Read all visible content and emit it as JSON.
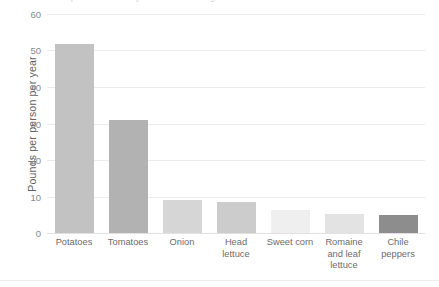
{
  "title_sliver": "Per capita availability of selected vegetables",
  "footer_rule": true,
  "axis": {
    "y_title": "Pounds per person per year",
    "y_ticks": [
      "60",
      "50",
      "40",
      "30",
      "20",
      "10",
      "0"
    ]
  },
  "chart_data": {
    "type": "bar",
    "title": "",
    "xlabel": "",
    "ylabel": "Pounds per person per year",
    "ylim": [
      0,
      60
    ],
    "yticks": [
      0,
      10,
      20,
      30,
      40,
      50,
      60
    ],
    "grid": true,
    "legend": "none",
    "categories": [
      "Potatoes",
      "Tomatoes",
      "Onion",
      "Head lettuce",
      "Sweet corn",
      "Romaine and leaf lettuce",
      "Chile peppers"
    ],
    "values": [
      51.7,
      31.0,
      9.0,
      8.5,
      6.3,
      5.1,
      4.9
    ],
    "bar_colors": [
      "#c2c2c2",
      "#b2b2b2",
      "#d6d6d6",
      "#cccccc",
      "#efefef",
      "#e3e3e3",
      "#8d8d8d"
    ]
  }
}
